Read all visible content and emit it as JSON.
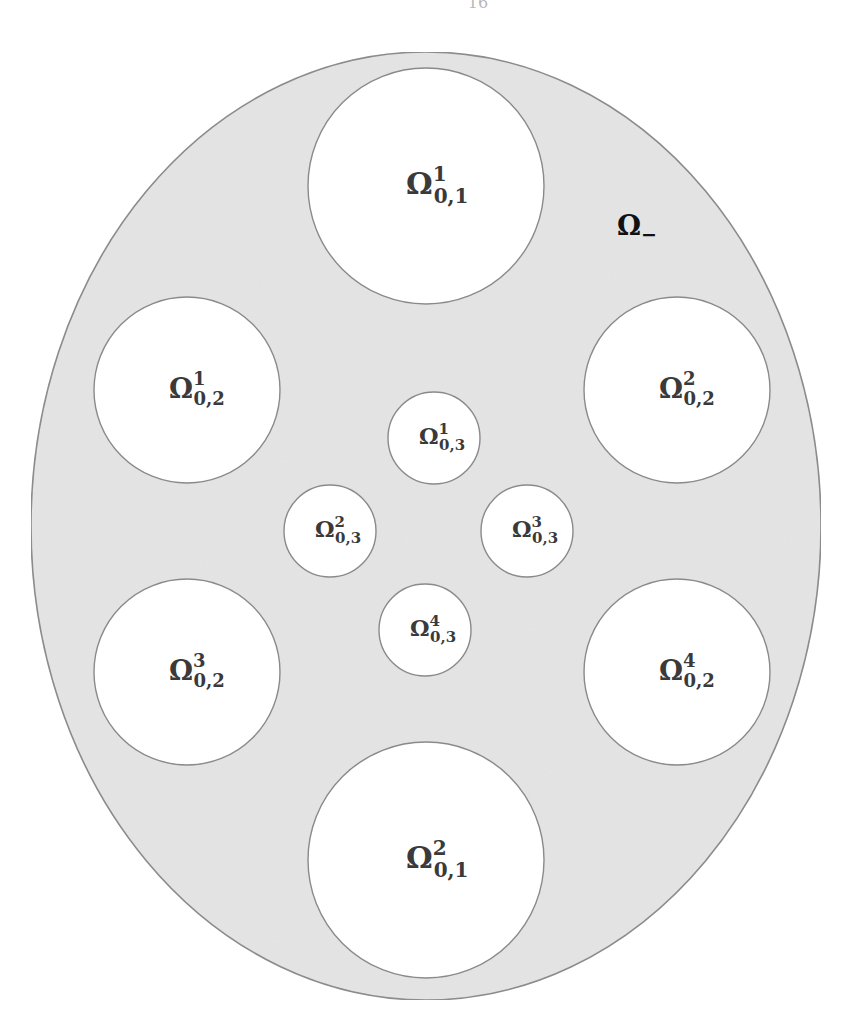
{
  "figure": {
    "page_mark": "16",
    "background_color": "#ffffff",
    "outer_domain": {
      "name": "outer-ellipse",
      "label_base": "Ω",
      "label_sub": "−",
      "label_full": "Ω₋",
      "fill_color": "#e4e4e4",
      "stroke_color": "#8a8a8a",
      "label_x": 637,
      "label_y": 227,
      "cx": 426,
      "cy": 526,
      "rx": 395,
      "ry": 474
    },
    "holes": [
      {
        "id": "omega-0-1-sup-1",
        "label_base": "Ω",
        "label_sup": "1",
        "label_sub": "0,1",
        "label_full": "Ω¹₀,₁",
        "size_class": "lg",
        "cx": 426,
        "cy": 186,
        "r": 118,
        "fill_color": "#ffffff",
        "stroke_color": "#8a8a8a"
      },
      {
        "id": "omega-0-1-sup-2",
        "label_base": "Ω",
        "label_sup": "2",
        "label_sub": "0,1",
        "label_full": "Ω²₀,₁",
        "size_class": "lg",
        "cx": 426,
        "cy": 860,
        "r": 118,
        "fill_color": "#ffffff",
        "stroke_color": "#8a8a8a"
      },
      {
        "id": "omega-0-2-sup-1",
        "label_base": "Ω",
        "label_sup": "1",
        "label_sub": "0,2",
        "label_full": "Ω¹₀,₂",
        "size_class": "md",
        "cx": 187,
        "cy": 390,
        "r": 93,
        "fill_color": "#ffffff",
        "stroke_color": "#8a8a8a"
      },
      {
        "id": "omega-0-2-sup-2",
        "label_base": "Ω",
        "label_sup": "2",
        "label_sub": "0,2",
        "label_full": "Ω²₀,₂",
        "size_class": "md",
        "cx": 677,
        "cy": 390,
        "r": 93,
        "fill_color": "#ffffff",
        "stroke_color": "#8a8a8a"
      },
      {
        "id": "omega-0-2-sup-3",
        "label_base": "Ω",
        "label_sup": "3",
        "label_sub": "0,2",
        "label_full": "Ω³₀,₂",
        "size_class": "md",
        "cx": 187,
        "cy": 672,
        "r": 93,
        "fill_color": "#ffffff",
        "stroke_color": "#8a8a8a"
      },
      {
        "id": "omega-0-2-sup-4",
        "label_base": "Ω",
        "label_sup": "4",
        "label_sub": "0,2",
        "label_full": "Ω⁴₀,₂",
        "size_class": "md",
        "cx": 677,
        "cy": 672,
        "r": 93,
        "fill_color": "#ffffff",
        "stroke_color": "#8a8a8a"
      },
      {
        "id": "omega-0-3-sup-1",
        "label_base": "Ω",
        "label_sup": "1",
        "label_sub": "0,3",
        "label_full": "Ω¹₀,₃",
        "size_class": "sm",
        "cx": 434,
        "cy": 438,
        "r": 46,
        "fill_color": "#ffffff",
        "stroke_color": "#8a8a8a"
      },
      {
        "id": "omega-0-3-sup-2",
        "label_base": "Ω",
        "label_sup": "2",
        "label_sub": "0,3",
        "label_full": "Ω²₀,₃",
        "size_class": "sm",
        "cx": 330,
        "cy": 531,
        "r": 46,
        "fill_color": "#ffffff",
        "stroke_color": "#8a8a8a"
      },
      {
        "id": "omega-0-3-sup-3",
        "label_base": "Ω",
        "label_sup": "3",
        "label_sub": "0,3",
        "label_full": "Ω³₀,₃",
        "size_class": "sm",
        "cx": 527,
        "cy": 531,
        "r": 46,
        "fill_color": "#ffffff",
        "stroke_color": "#8a8a8a"
      },
      {
        "id": "omega-0-3-sup-4",
        "label_base": "Ω",
        "label_sup": "4",
        "label_sub": "0,3",
        "label_full": "Ω⁴₀,₃",
        "size_class": "sm",
        "cx": 425,
        "cy": 630,
        "r": 46,
        "fill_color": "#ffffff",
        "stroke_color": "#8a8a8a"
      }
    ]
  }
}
